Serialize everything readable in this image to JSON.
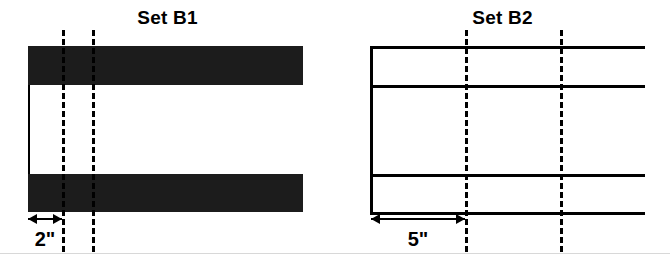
{
  "figure": {
    "width": 670,
    "height": 264,
    "background": "#ffffff",
    "ink": "#000000",
    "fill": "#1c1c1c"
  },
  "panels": [
    {
      "id": "set-b1",
      "title": "Set B1",
      "style": "filled",
      "left": 0,
      "width": 335,
      "title_center_x": 180,
      "body_left": 28,
      "body_right": 303,
      "bars": [
        {
          "name": "top-bar",
          "y": 46,
          "height": 39
        },
        {
          "name": "bottom-bar",
          "y": 174,
          "height": 38
        }
      ],
      "left_edge": {
        "x": 28,
        "y": 85,
        "height": 89,
        "width": 2
      },
      "dashed_lines": [
        {
          "name": "station-line-1",
          "x": 62,
          "y": 30,
          "height": 222
        },
        {
          "name": "station-line-2",
          "x": 92,
          "y": 30,
          "height": 222
        }
      ],
      "dimension": {
        "label": "2\"",
        "from_x": 28,
        "to_x": 62,
        "y": 218,
        "label_y": 228
      }
    },
    {
      "id": "set-b2",
      "title": "Set B2",
      "style": "outline",
      "left": 335,
      "width": 335,
      "title_center_x": 520,
      "body_left": 370,
      "body_right": 645,
      "rules": [
        {
          "name": "rule-1",
          "y": 46
        },
        {
          "name": "rule-2",
          "y": 85
        },
        {
          "name": "rule-3",
          "y": 174
        },
        {
          "name": "rule-4",
          "y": 212
        }
      ],
      "left_edge": {
        "x": 370,
        "y": 46,
        "height": 168,
        "width": 2
      },
      "dashed_lines": [
        {
          "name": "station-line-1",
          "x": 465,
          "y": 30,
          "height": 222
        },
        {
          "name": "station-line-2",
          "x": 560,
          "y": 30,
          "height": 222
        }
      ],
      "dimension": {
        "label": "5\"",
        "from_x": 370,
        "to_x": 465,
        "y": 218,
        "label_y": 228
      }
    }
  ],
  "footer_rule": {
    "y": 253,
    "color": "#d8d8d8"
  }
}
